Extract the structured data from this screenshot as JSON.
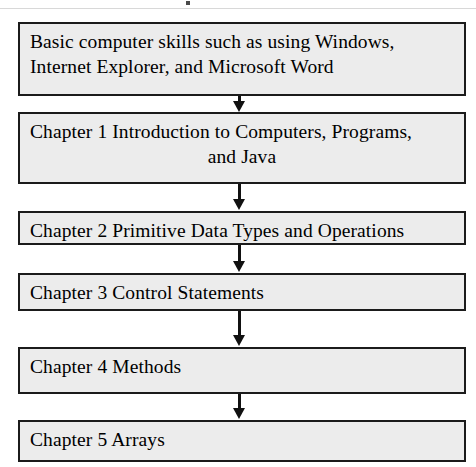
{
  "figure": {
    "type": "vertical-flowchart",
    "orientation": "top-to-bottom",
    "background_color": "#ffffff",
    "box_fill_color": "#ececec",
    "box_border_color": "#1b1b1b",
    "text_color": "#000000",
    "arrow_color": "#111111"
  },
  "nodes": [
    {
      "id": "prereq",
      "lines": [
        "Basic computer skills such as using Windows,",
        "Internet Explorer, and Microsoft Word"
      ],
      "align": [
        "left",
        "left"
      ]
    },
    {
      "id": "chapter1",
      "lines": [
        "Chapter 1 Introduction to Computers, Programs,",
        "and Java"
      ],
      "align": [
        "left",
        "center"
      ]
    },
    {
      "id": "chapter2",
      "lines": [
        "Chapter 2 Primitive Data Types and Operations"
      ],
      "align": [
        "left"
      ]
    },
    {
      "id": "chapter3",
      "lines": [
        "Chapter 3 Control Statements"
      ],
      "align": [
        "left"
      ]
    },
    {
      "id": "chapter4",
      "lines": [
        "Chapter 4 Methods"
      ],
      "align": [
        "left"
      ]
    },
    {
      "id": "chapter5",
      "lines": [
        "Chapter 5 Arrays"
      ],
      "align": [
        "left"
      ]
    }
  ],
  "connectors": [
    {
      "id": "connector-1",
      "from": "prereq",
      "to": "chapter1",
      "glyph": "down-arrow"
    },
    {
      "id": "connector-2",
      "from": "chapter1",
      "to": "chapter2",
      "glyph": "down-arrow"
    },
    {
      "id": "connector-3",
      "from": "chapter2",
      "to": "chapter3",
      "glyph": "down-arrow"
    },
    {
      "id": "connector-4",
      "from": "chapter3",
      "to": "chapter4",
      "glyph": "down-arrow"
    },
    {
      "id": "connector-5",
      "from": "chapter4",
      "to": "chapter5",
      "glyph": "down-arrow"
    }
  ]
}
